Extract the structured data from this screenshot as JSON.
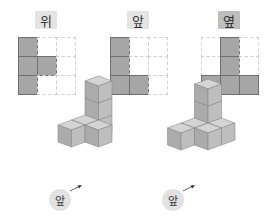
{
  "views": [
    {
      "label": "위",
      "highlight": false,
      "rows": 3,
      "cols": 3,
      "filled": [
        [
          1,
          0,
          0
        ],
        [
          1,
          1,
          0
        ],
        [
          1,
          0,
          0
        ]
      ]
    },
    {
      "label": "앞",
      "highlight": false,
      "rows": 3,
      "cols": 3,
      "filled": [
        [
          1,
          0,
          0
        ],
        [
          1,
          0,
          0
        ],
        [
          1,
          1,
          0
        ]
      ]
    },
    {
      "label": "옆",
      "highlight": true,
      "rows": 3,
      "cols": 3,
      "filled": [
        [
          0,
          1,
          0
        ],
        [
          0,
          1,
          0
        ],
        [
          1,
          1,
          1
        ]
      ]
    }
  ],
  "structures": [
    {
      "front_label": "앞",
      "cubes": [
        [
          0,
          0,
          0
        ],
        [
          0,
          0,
          1
        ],
        [
          0,
          0,
          2
        ],
        [
          0,
          1,
          0
        ],
        [
          0,
          2,
          0
        ],
        [
          1,
          1,
          0
        ]
      ]
    },
    {
      "front_label": "앞",
      "cubes": [
        [
          0,
          0,
          0
        ],
        [
          0,
          0,
          1
        ],
        [
          0,
          0,
          2
        ],
        [
          1,
          0,
          0
        ],
        [
          0,
          1,
          0
        ],
        [
          0,
          2,
          0
        ],
        [
          1,
          1,
          0
        ]
      ]
    }
  ],
  "colors": {
    "cell_fill": "#a6a6a6",
    "cell_border": "#6f6f6f",
    "grid_dash": "#cfcfcf",
    "cube_top": "#d4d4d4",
    "cube_left": "#ababab",
    "cube_right": "#bebebe",
    "cube_edge": "#8a8a8a"
  }
}
